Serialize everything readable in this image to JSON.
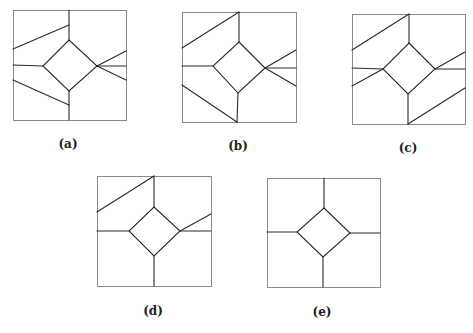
{
  "colors": {
    "frame": "#8a8a8a",
    "edge": "#2a2a2a",
    "label": "#222222",
    "background": "#ffffff"
  },
  "panels": [
    {
      "id": "a",
      "label": "(a)",
      "label_pos": [
        68,
        148
      ],
      "box": [
        13,
        10,
        126,
        120
      ],
      "diamond": [
        [
          69,
          40
        ],
        [
          97,
          66
        ],
        [
          69,
          91
        ],
        [
          43,
          66
        ]
      ],
      "edges": [
        [
          [
            69,
            10
          ],
          [
            69,
            40
          ]
        ],
        [
          [
            69,
            25
          ],
          [
            13,
            49
          ]
        ],
        [
          [
            13,
            65
          ],
          [
            43,
            66
          ]
        ],
        [
          [
            13,
            80
          ],
          [
            69,
            105
          ]
        ],
        [
          [
            69,
            91
          ],
          [
            69,
            120
          ]
        ],
        [
          [
            97,
            66
          ],
          [
            126,
            51
          ]
        ],
        [
          [
            97,
            66
          ],
          [
            126,
            66
          ]
        ],
        [
          [
            97,
            66
          ],
          [
            126,
            80
          ]
        ]
      ]
    },
    {
      "id": "b",
      "label": "(b)",
      "label_pos": [
        238,
        150
      ],
      "box": [
        182,
        12,
        296,
        122
      ],
      "diamond": [
        [
          239,
          42
        ],
        [
          265,
          68
        ],
        [
          238,
          93
        ],
        [
          213,
          66
        ]
      ],
      "edges": [
        [
          [
            239,
            12
          ],
          [
            239,
            42
          ]
        ],
        [
          [
            239,
            12
          ],
          [
            182,
            48
          ]
        ],
        [
          [
            182,
            66
          ],
          [
            213,
            66
          ]
        ],
        [
          [
            182,
            85
          ],
          [
            237,
            122
          ]
        ],
        [
          [
            238,
            93
          ],
          [
            237,
            122
          ]
        ],
        [
          [
            265,
            68
          ],
          [
            296,
            50
          ]
        ],
        [
          [
            265,
            68
          ],
          [
            296,
            68
          ]
        ],
        [
          [
            265,
            68
          ],
          [
            296,
            86
          ]
        ]
      ]
    },
    {
      "id": "c",
      "label": "(c)",
      "label_pos": [
        408,
        152
      ],
      "box": [
        352,
        14,
        465,
        124
      ],
      "diamond": [
        [
          409,
          43
        ],
        [
          435,
          69
        ],
        [
          408,
          94
        ],
        [
          383,
          69
        ]
      ],
      "edges": [
        [
          [
            409,
            14
          ],
          [
            409,
            43
          ]
        ],
        [
          [
            409,
            14
          ],
          [
            352,
            50
          ]
        ],
        [
          [
            352,
            68
          ],
          [
            383,
            69
          ]
        ],
        [
          [
            383,
            69
          ],
          [
            352,
            86
          ]
        ],
        [
          [
            408,
            94
          ],
          [
            408,
            124
          ]
        ],
        [
          [
            408,
            124
          ],
          [
            465,
            88
          ]
        ],
        [
          [
            435,
            69
          ],
          [
            465,
            69
          ]
        ],
        [
          [
            435,
            69
          ],
          [
            465,
            52
          ]
        ]
      ]
    },
    {
      "id": "d",
      "label": "(d)",
      "label_pos": [
        153,
        315
      ],
      "box": [
        97,
        176,
        211,
        286
      ],
      "diamond": [
        [
          154,
          207
        ],
        [
          180,
          231
        ],
        [
          154,
          256
        ],
        [
          129,
          231
        ]
      ],
      "edges": [
        [
          [
            154,
            176
          ],
          [
            154,
            207
          ]
        ],
        [
          [
            154,
            176
          ],
          [
            97,
            212
          ]
        ],
        [
          [
            97,
            231
          ],
          [
            129,
            231
          ]
        ],
        [
          [
            154,
            256
          ],
          [
            154,
            286
          ]
        ],
        [
          [
            180,
            231
          ],
          [
            211,
            231
          ]
        ],
        [
          [
            180,
            231
          ],
          [
            211,
            214
          ]
        ]
      ]
    },
    {
      "id": "e",
      "label": "(e)",
      "label_pos": [
        322,
        316
      ],
      "box": [
        267,
        178,
        380,
        287
      ],
      "diamond": [
        [
          324,
          208
        ],
        [
          350,
          233
        ],
        [
          323,
          257
        ],
        [
          297,
          232
        ]
      ],
      "edges": [
        [
          [
            324,
            178
          ],
          [
            324,
            208
          ]
        ],
        [
          [
            267,
            232
          ],
          [
            297,
            232
          ]
        ],
        [
          [
            323,
            257
          ],
          [
            323,
            287
          ]
        ],
        [
          [
            350,
            233
          ],
          [
            380,
            233
          ]
        ]
      ]
    }
  ]
}
